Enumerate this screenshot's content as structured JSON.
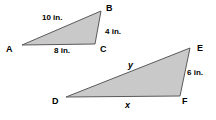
{
  "figure": {
    "fill_color": "#c9c9c9",
    "stroke_color": "#5a5a5a",
    "background_color": "#ffffff",
    "text_color": "#000000"
  },
  "triangle_abc": {
    "name": "triangle-abc",
    "vertices": {
      "A": "A",
      "B": "B",
      "C": "C"
    },
    "sides": {
      "ab": "10 in.",
      "bc": "4 in.",
      "ac": "8 in."
    },
    "points": {
      "A": [
        22,
        45
      ],
      "B": [
        101,
        11
      ],
      "C": [
        95,
        44
      ]
    }
  },
  "triangle_def": {
    "name": "triangle-def",
    "vertices": {
      "D": "D",
      "E": "E",
      "F": "F"
    },
    "sides": {
      "de": "y",
      "ef": "6 in.",
      "df": "x"
    },
    "points": {
      "D": [
        66,
        97
      ],
      "E": [
        190,
        48
      ],
      "F": [
        180,
        96
      ]
    }
  }
}
